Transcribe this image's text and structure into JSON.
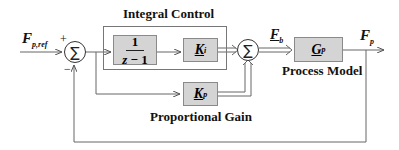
{
  "title_integral": "Integral Control",
  "title_process": "Process Model",
  "title_proportional": "Proportional Gain",
  "signals": {
    "input_main": "F",
    "input_sub": "p,ref",
    "bias_main": "F",
    "bias_sub": "b",
    "output_main": "F",
    "output_sub": "p"
  },
  "summer_left": {
    "symbol": "∑",
    "plus_sign": "+",
    "minus_sign": "−"
  },
  "summer_right": {
    "symbol": "∑"
  },
  "blocks": {
    "integrator": {
      "numerator": "1",
      "denominator_var": "z",
      "denominator_op": "−",
      "denominator_const": "1"
    },
    "ki": {
      "main": "K",
      "sub": "i"
    },
    "kp": {
      "main": "K",
      "sub": "p"
    },
    "gp": {
      "main": "G",
      "sub": "p"
    }
  }
}
